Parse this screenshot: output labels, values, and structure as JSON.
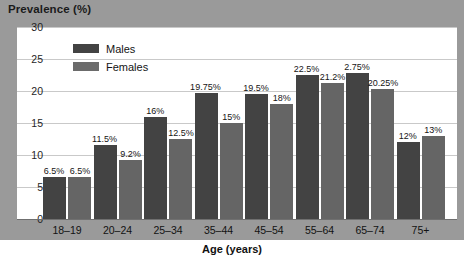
{
  "chart_data": {
    "type": "bar",
    "title": "",
    "xlabel": "Age (years)",
    "ylabel": "Prevalence (%)",
    "ylim": [
      0,
      30
    ],
    "yticks": [
      0,
      5,
      10,
      15,
      20,
      25,
      30
    ],
    "grid": true,
    "legend_position": "top-left-inside",
    "categories": [
      "18–19",
      "20–24",
      "25–34",
      "35–44",
      "45–54",
      "55–64",
      "65–74",
      "75+"
    ],
    "series": [
      {
        "name": "Males",
        "color": "#434343",
        "values": [
          6.5,
          11.5,
          16,
          19.75,
          19.5,
          22.5,
          22.75,
          12
        ],
        "labels": [
          "6.5%",
          "11.5%",
          "16%",
          "19.75%",
          "19.5%",
          "22.5%",
          "2.75%",
          "12%"
        ]
      },
      {
        "name": "Females",
        "color": "#656565",
        "values": [
          6.5,
          9.2,
          12.5,
          15,
          18,
          21.2,
          20.25,
          13
        ],
        "labels": [
          "6.5%",
          "9.2%",
          "12.5%",
          "15%",
          "18%",
          "21.2%",
          "20.25%",
          "13%"
        ]
      }
    ]
  }
}
